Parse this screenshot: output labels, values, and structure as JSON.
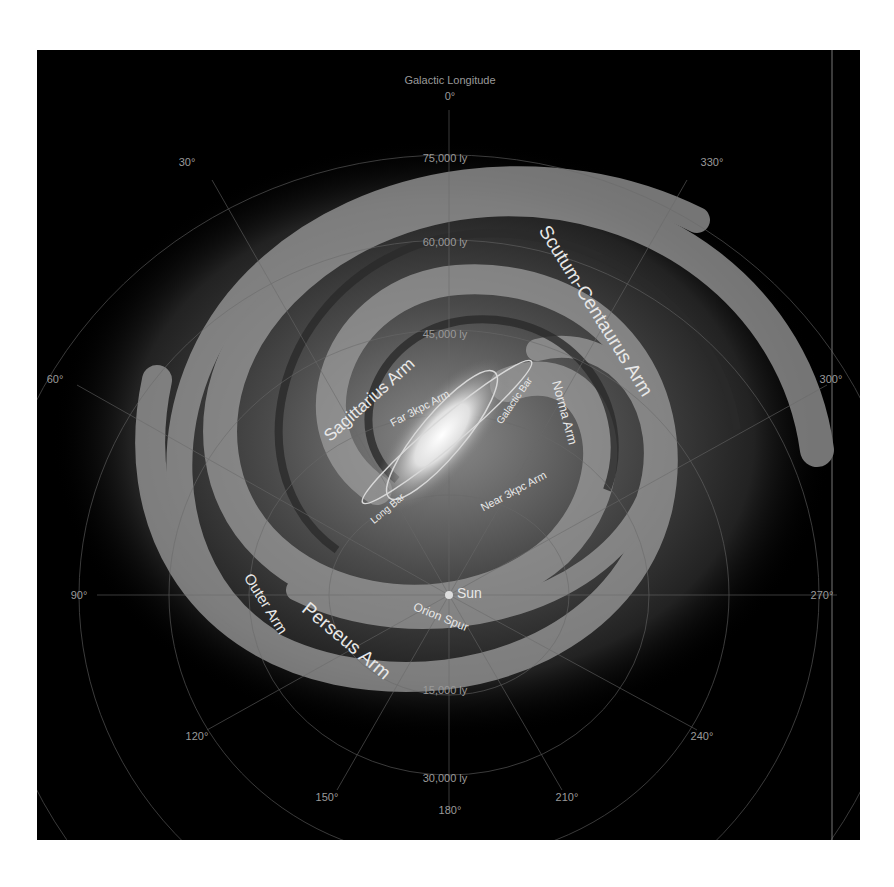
{
  "title": "Galactic Longitude",
  "colors": {
    "background": "#000000",
    "page": "#ffffff",
    "grid": "#6a6a6a",
    "label_dim": "#9a9a9a",
    "label_bright": "#e8e8e8",
    "core": "#ffffff"
  },
  "longitudes": [
    {
      "label": "0°",
      "x": 413,
      "y": 46
    },
    {
      "label": "30°",
      "x": 150,
      "y": 112
    },
    {
      "label": "330°",
      "x": 675,
      "y": 112
    },
    {
      "label": "60°",
      "x": 18,
      "y": 329
    },
    {
      "label": "300°",
      "x": 794,
      "y": 329
    },
    {
      "label": "90°",
      "x": 42,
      "y": 545
    },
    {
      "label": "270°",
      "x": 778,
      "y": 545
    },
    {
      "label": "120°",
      "x": 160,
      "y": 686
    },
    {
      "label": "240°",
      "x": 665,
      "y": 686
    },
    {
      "label": "150°",
      "x": 290,
      "y": 747
    },
    {
      "label": "210°",
      "x": 530,
      "y": 747
    },
    {
      "label": "180°",
      "x": 413,
      "y": 760
    }
  ],
  "distances": [
    {
      "label": "75,000 ly",
      "x": 408,
      "y": 108
    },
    {
      "label": "60,000 ly",
      "x": 408,
      "y": 192
    },
    {
      "label": "45,000 ly",
      "x": 408,
      "y": 284
    },
    {
      "label": "15,000 ly",
      "x": 408,
      "y": 640
    },
    {
      "label": "30,000 ly",
      "x": 408,
      "y": 728
    }
  ],
  "features": [
    {
      "name": "Scutum-Centaurus Arm",
      "size": 19
    },
    {
      "name": "Sagittarius Arm",
      "size": 17
    },
    {
      "name": "Norma Arm",
      "size": 13
    },
    {
      "name": "Perseus Arm",
      "size": 19
    },
    {
      "name": "Outer Arm",
      "size": 15
    },
    {
      "name": "Far 3kpc Arm",
      "size": 11
    },
    {
      "name": "Near 3kpc Arm",
      "size": 11
    },
    {
      "name": "Galactic Bar",
      "size": 10
    },
    {
      "name": "Long Bar",
      "size": 10
    },
    {
      "name": "Orion Spur",
      "size": 12
    },
    {
      "name": "Sun",
      "size": 14
    }
  ]
}
